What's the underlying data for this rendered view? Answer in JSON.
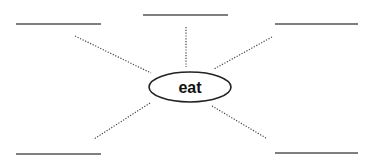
{
  "diagram": {
    "type": "word-web",
    "center_word": "eat",
    "answer_blanks": [
      {
        "id": "top-left",
        "text": ""
      },
      {
        "id": "top-middle",
        "text": ""
      },
      {
        "id": "top-right",
        "text": ""
      },
      {
        "id": "bottom-left",
        "text": ""
      },
      {
        "id": "bottom-right",
        "text": ""
      }
    ],
    "colors": {
      "line": "#555555",
      "spoke": "#444444",
      "oval_stroke": "#222222",
      "text": "#111111"
    }
  }
}
